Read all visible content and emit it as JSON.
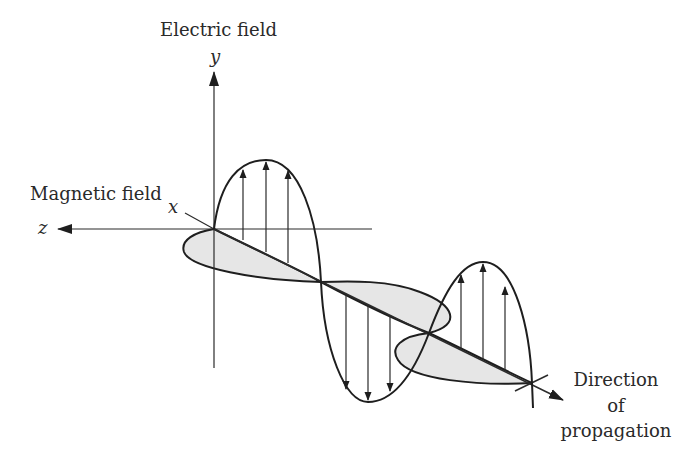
{
  "diagram": {
    "labels": {
      "electric_field": "Electric field",
      "magnetic_field": "Magnetic field",
      "direction_line1": "Direction",
      "direction_line2": "of",
      "direction_line3": "propagation"
    },
    "axes": {
      "y": "y",
      "z": "z",
      "x": "x"
    },
    "colors": {
      "stroke": "#1e1e1e",
      "magnetic_fill": "#e6e6e6",
      "background": "#ffffff",
      "text": "#2a2a2a"
    },
    "key_points": {
      "origin": [
        214,
        229
      ],
      "nodes": [
        [
          321,
          282
        ],
        [
          429,
          333
        ],
        [
          532,
          383
        ]
      ],
      "e_peaks": [
        [
          266,
          160
        ],
        [
          368,
          402
        ],
        [
          483,
          262
        ]
      ],
      "propagation_arrow_tip": [
        563,
        400
      ]
    }
  }
}
